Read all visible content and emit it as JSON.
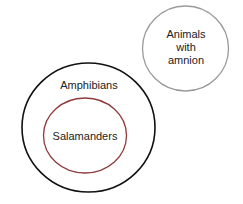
{
  "diagram": {
    "type": "euler-diagram",
    "circles": [
      {
        "id": "amnion",
        "label_lines": [
          "Animals",
          "with",
          "amnion"
        ],
        "stroke": "#9a9a9a",
        "cx": 185.5,
        "cy": 48.5,
        "rx": 43,
        "ry": 42.5
      },
      {
        "id": "amphibians",
        "label": "Amphibians",
        "stroke": "#111111",
        "cx": 88.5,
        "cy": 127.5,
        "rx": 66.5,
        "ry": 64.5
      },
      {
        "id": "salamanders",
        "label": "Salamanders",
        "stroke": "#8e3a3a",
        "cx": 85,
        "cy": 135.5,
        "rx": 41.5,
        "ry": 37.5,
        "inside": "amphibians"
      }
    ]
  }
}
